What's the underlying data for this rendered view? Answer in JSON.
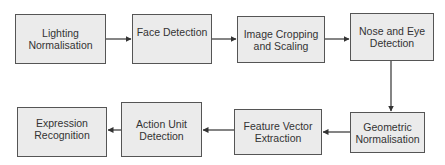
{
  "diagram": {
    "type": "flowchart",
    "colors": {
      "box_fill": "#ebebeb",
      "box_border": "#555555",
      "arrow": "#333333",
      "text": "#333333"
    },
    "nodes": [
      {
        "id": "n1",
        "label": "Lighting Normalisation"
      },
      {
        "id": "n2",
        "label": "Face Detection"
      },
      {
        "id": "n3",
        "label": "Image Cropping and Scaling"
      },
      {
        "id": "n4",
        "label": "Nose and Eye Detection"
      },
      {
        "id": "n5",
        "label": "Geometric Normalisation"
      },
      {
        "id": "n6",
        "label": "Feature Vector Extraction"
      },
      {
        "id": "n7",
        "label": "Action Unit Detection"
      },
      {
        "id": "n8",
        "label": "Expression Recognition"
      }
    ],
    "edges": [
      {
        "from": "n1",
        "to": "n2"
      },
      {
        "from": "n2",
        "to": "n3"
      },
      {
        "from": "n3",
        "to": "n4"
      },
      {
        "from": "n4",
        "to": "n5"
      },
      {
        "from": "n5",
        "to": "n6"
      },
      {
        "from": "n6",
        "to": "n7"
      },
      {
        "from": "n7",
        "to": "n8"
      }
    ]
  }
}
